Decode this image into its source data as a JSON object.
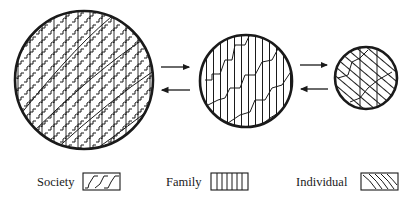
{
  "diagram": {
    "type": "nested-levels",
    "circles": [
      {
        "id": "society-circle",
        "level": "Society",
        "cx": 84,
        "cy": 80,
        "r": 70,
        "patterns": [
          "society",
          "family",
          "individual"
        ]
      },
      {
        "id": "family-circle",
        "level": "Family",
        "cx": 246,
        "cy": 81,
        "r": 47,
        "patterns": [
          "family",
          "individual"
        ]
      },
      {
        "id": "individual-circle",
        "level": "Individual",
        "cx": 366,
        "cy": 78,
        "r": 32,
        "patterns": [
          "individual"
        ]
      }
    ],
    "arrows": [
      {
        "from": "Society",
        "to": "Family",
        "direction": "right"
      },
      {
        "from": "Family",
        "to": "Society",
        "direction": "left"
      },
      {
        "from": "Family",
        "to": "Individual",
        "direction": "right"
      },
      {
        "from": "Individual",
        "to": "Family",
        "direction": "left"
      }
    ]
  },
  "legend": {
    "items": [
      {
        "label": "Society",
        "pattern": "stepped-wave"
      },
      {
        "label": "Family",
        "pattern": "vertical-lines"
      },
      {
        "label": "Individual",
        "pattern": "diagonal-curves"
      }
    ]
  },
  "colors": {
    "ink": "#1a1a1a",
    "background": "#ffffff"
  }
}
